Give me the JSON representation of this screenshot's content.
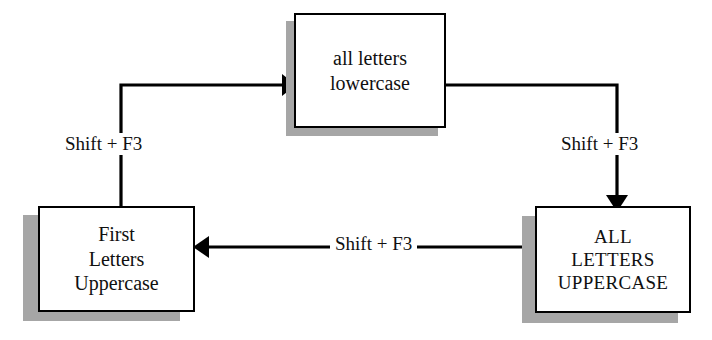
{
  "diagram": {
    "colors": {
      "stroke": "#000000",
      "box_fill": "#ffffff",
      "shadow": "#a6a6a6",
      "text": "#101010",
      "background": "#ffffff"
    },
    "nodes": [
      {
        "id": "lowercase",
        "label": "all letters\nlowercase",
        "position": "top-center"
      },
      {
        "id": "first-letters-uppercase",
        "label": "First\nLetters\nUppercase",
        "position": "bottom-left"
      },
      {
        "id": "all-letters-uppercase",
        "label": "ALL\nLETTERS\nUPPERCASE",
        "position": "bottom-right"
      }
    ],
    "edges": [
      {
        "id": "first-to-lowercase",
        "from": "first-letters-uppercase",
        "to": "lowercase",
        "label": "Shift + F3",
        "arrow": "right"
      },
      {
        "id": "lowercase-to-allcaps",
        "from": "lowercase",
        "to": "all-letters-uppercase",
        "label": "Shift + F3",
        "arrow": "down"
      },
      {
        "id": "allcaps-to-first",
        "from": "all-letters-uppercase",
        "to": "first-letters-uppercase",
        "label": "Shift + F3",
        "arrow": "left"
      }
    ]
  }
}
